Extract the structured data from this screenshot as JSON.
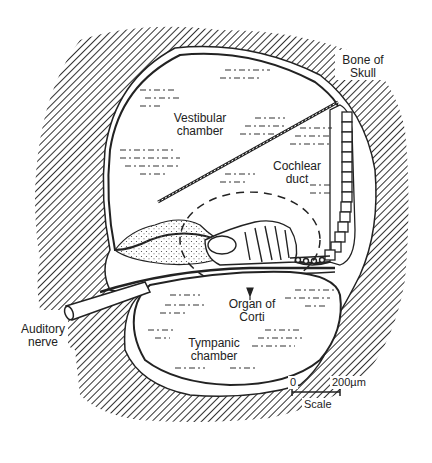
{
  "figure": {
    "type": "anatomical cross-section",
    "subject": "cochlea"
  },
  "labels": {
    "bone_of_skull": "Bone of\nSkull",
    "bone_of_skull_line1": "Bone of",
    "bone_of_skull_line2": "Skull",
    "vestibular_line1": "Vestibular",
    "vestibular_line2": "chamber",
    "cochlear_line1": "Cochlear",
    "cochlear_line2": "duct",
    "organ_line1": "Organ of",
    "organ_line2": "Corti",
    "tympanic_line1": "Tympanic",
    "tympanic_line2": "chamber",
    "auditory_line1": "Auditory",
    "auditory_line2": "nerve"
  },
  "scale_bar": {
    "start": "0",
    "end": "200µm",
    "label": "Scale"
  },
  "colors": {
    "ink": "#222222",
    "background": "#ffffff"
  }
}
